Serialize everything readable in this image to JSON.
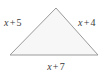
{
  "figure": {
    "shape": "triangle",
    "background_color": "#ffffff",
    "fill_color": "#f7f7f7",
    "stroke_color": "#9a9a9a",
    "text_color": "#3a3a3a",
    "vertices": {
      "apex": [
        56,
        8
      ],
      "bottom_left": [
        10,
        55
      ],
      "bottom_right": [
        98,
        55
      ]
    }
  },
  "labels": {
    "left": {
      "text": "x + 5",
      "variable": "x",
      "operator": "+",
      "constant": "5"
    },
    "right": {
      "text": "x + 4",
      "variable": "x",
      "operator": "+",
      "constant": "4"
    },
    "bottom": {
      "text": "x + 7",
      "variable": "x",
      "operator": "+",
      "constant": "7"
    }
  }
}
